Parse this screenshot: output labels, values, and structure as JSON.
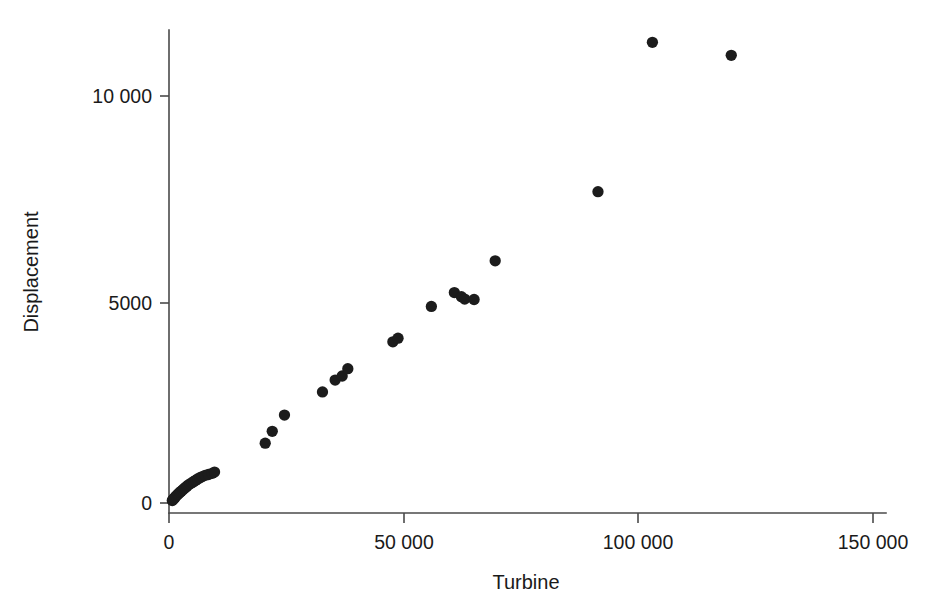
{
  "chart_data": {
    "type": "scatter",
    "title": "",
    "subtitle": "",
    "xlabel": "Turbine",
    "ylabel": "Displacement",
    "xlim": [
      0,
      157000
    ],
    "ylim": [
      -400,
      12400
    ],
    "xticks": [
      0,
      50000,
      100000,
      150000
    ],
    "xtick_labels": [
      "0",
      "50 000",
      "100 000",
      "150 000"
    ],
    "yticks": [
      0,
      5000,
      10000
    ],
    "ytick_labels": [
      "0",
      "5000",
      "10 000"
    ],
    "grid": false,
    "legend": null,
    "marker": {
      "shape": "circle",
      "color": "#1c1c1c",
      "size_px": 6.5
    },
    "annotations": [],
    "n_points": 44,
    "x": [
      700,
      900,
      1100,
      1300,
      1500,
      1800,
      2000,
      2300,
      2600,
      2900,
      3200,
      3500,
      3800,
      4100,
      4500,
      4900,
      5300,
      5700,
      6100,
      6600,
      7100,
      7700,
      8400,
      9200,
      9700,
      20500,
      22000,
      24600,
      32700,
      35400,
      36900,
      38100,
      47700,
      48800,
      55900,
      60800,
      62300,
      63000,
      65000,
      69500,
      91400,
      103000,
      119800
    ],
    "y": [
      60,
      90,
      110,
      140,
      170,
      200,
      230,
      260,
      290,
      320,
      350,
      380,
      410,
      440,
      470,
      500,
      530,
      560,
      590,
      620,
      650,
      680,
      700,
      730,
      760,
      1470,
      1760,
      2160,
      2730,
      3020,
      3120,
      3300,
      3960,
      4050,
      4830,
      5170,
      5070,
      5010,
      5000,
      5950,
      7650,
      11320,
      11000
    ],
    "series": [
      {
        "name": "Displacement vs Turbine",
        "points": [
          [
            700,
            60
          ],
          [
            900,
            90
          ],
          [
            1100,
            110
          ],
          [
            1300,
            140
          ],
          [
            1500,
            170
          ],
          [
            1800,
            200
          ],
          [
            2000,
            230
          ],
          [
            2300,
            260
          ],
          [
            2600,
            290
          ],
          [
            2900,
            320
          ],
          [
            3200,
            350
          ],
          [
            3500,
            380
          ],
          [
            3800,
            410
          ],
          [
            4100,
            440
          ],
          [
            4500,
            470
          ],
          [
            4900,
            500
          ],
          [
            5300,
            530
          ],
          [
            5700,
            560
          ],
          [
            6100,
            590
          ],
          [
            6600,
            620
          ],
          [
            7100,
            650
          ],
          [
            7700,
            680
          ],
          [
            8400,
            700
          ],
          [
            9200,
            730
          ],
          [
            9700,
            760
          ],
          [
            20500,
            1470
          ],
          [
            22000,
            1760
          ],
          [
            24600,
            2160
          ],
          [
            32700,
            2730
          ],
          [
            35400,
            3020
          ],
          [
            36900,
            3120
          ],
          [
            38100,
            3300
          ],
          [
            47700,
            3960
          ],
          [
            48800,
            4050
          ],
          [
            55900,
            4830
          ],
          [
            60800,
            5170
          ],
          [
            62300,
            5070
          ],
          [
            63000,
            5010
          ],
          [
            65000,
            5000
          ],
          [
            69500,
            5950
          ],
          [
            91400,
            7650
          ],
          [
            103000,
            11320
          ],
          [
            119800,
            11000
          ]
        ]
      }
    ]
  },
  "axes": {
    "x_axis_label": "Turbine",
    "y_axis_label": "Displacement",
    "x_tick_0": "0",
    "x_tick_1": "50 000",
    "x_tick_2": "100 000",
    "x_tick_3": "150 000",
    "y_tick_0": "0",
    "y_tick_1": "5000",
    "y_tick_2": "10 000"
  },
  "colors": {
    "marker": "#1c1c1c",
    "axis": "#4a4a4a",
    "background": "#ffffff",
    "text": "#1a1a1a"
  }
}
